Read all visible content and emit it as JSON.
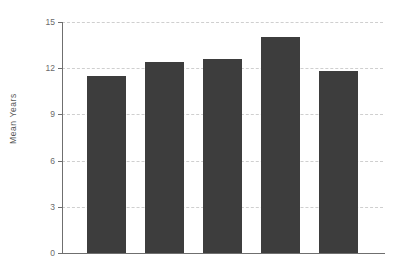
{
  "chart_data": {
    "type": "bar",
    "title": "",
    "xlabel": "",
    "ylabel": "Mean Years",
    "categories": [
      "2000",
      "2001",
      "2002",
      "2003",
      "2004"
    ],
    "values": [
      11.5,
      12.4,
      12.6,
      14.0,
      11.8
    ],
    "ylim": [
      0,
      15
    ],
    "yticks": [
      0,
      3,
      6,
      9,
      12,
      15
    ],
    "ytick_labels": [
      "0",
      "3",
      "6",
      "9",
      "12",
      "15"
    ],
    "grid": true,
    "grid_axis": "y",
    "grid_style": "dashed",
    "legend": false,
    "bar_color": "#3d3d3d",
    "grid_color": "#cfcfcf",
    "axis_color": "#6f6f6f",
    "tick_label_color": "#6a6a6a",
    "background": "#ffffff"
  },
  "title_fragment": ""
}
